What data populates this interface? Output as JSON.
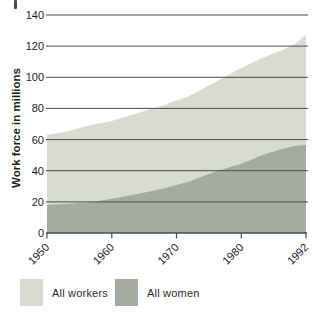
{
  "chart_data": {
    "type": "area",
    "title": "",
    "xlabel": "",
    "ylabel": "Work force in millions",
    "ylim": [
      0,
      140
    ],
    "yticks": [
      140,
      120,
      100,
      80,
      60,
      40,
      20,
      0
    ],
    "xticks": [
      "1950",
      "1960",
      "1970",
      "1980",
      "1992"
    ],
    "grid": true,
    "legend_position": "bottom",
    "colors": {
      "grid": "#4a4a4a",
      "text": "#1c1c1c"
    },
    "series": [
      {
        "name": "All workers",
        "color": "#d7dbd0",
        "points": [
          [
            1950,
            63
          ],
          [
            1953,
            65
          ],
          [
            1956,
            68.5
          ],
          [
            1960,
            72
          ],
          [
            1964,
            77
          ],
          [
            1968,
            82
          ],
          [
            1972,
            88
          ],
          [
            1976,
            97
          ],
          [
            1980,
            106
          ],
          [
            1984,
            112.5
          ],
          [
            1988,
            118
          ],
          [
            1990,
            121.5
          ],
          [
            1992,
            127.5
          ]
        ]
      },
      {
        "name": "All women",
        "color": "#a5ab9e",
        "points": [
          [
            1950,
            18
          ],
          [
            1954,
            19
          ],
          [
            1957,
            20
          ],
          [
            1960,
            22
          ],
          [
            1964,
            25
          ],
          [
            1968,
            28.5
          ],
          [
            1972,
            33
          ],
          [
            1976,
            39.5
          ],
          [
            1980,
            44.5
          ],
          [
            1984,
            50
          ],
          [
            1987,
            53.5
          ],
          [
            1990,
            56
          ],
          [
            1992,
            56.5
          ]
        ]
      }
    ]
  },
  "legend": {
    "items": [
      {
        "label": "All workers"
      },
      {
        "label": "All women"
      }
    ]
  }
}
